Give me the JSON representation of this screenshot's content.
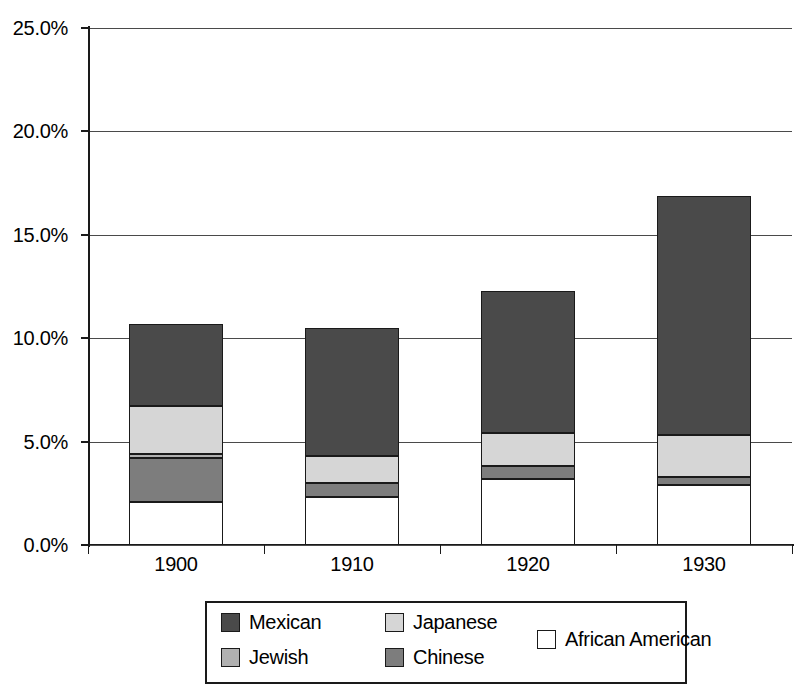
{
  "chart_data": {
    "type": "bar",
    "subtype": "stacked-bar",
    "title": "",
    "xlabel": "",
    "ylabel": "",
    "categories": [
      "1900",
      "1910",
      "1920",
      "1930"
    ],
    "ylim": [
      0,
      25
    ],
    "ytick_labels": [
      "0.0%",
      "5.0%",
      "10.0%",
      "15.0%",
      "20.0%",
      "25.0%"
    ],
    "ytick_values": [
      0,
      5,
      10,
      15,
      20,
      25
    ],
    "yaxis_unit": "%",
    "grid": true,
    "legend_position": "bottom",
    "stack_order_bottom_to_top": [
      "African American",
      "Chinese",
      "Jewish",
      "Japanese",
      "Mexican"
    ],
    "series": [
      {
        "name": "African American",
        "color": "#ffffff",
        "values": [
          2.1,
          2.3,
          3.2,
          2.9
        ]
      },
      {
        "name": "Chinese",
        "color": "#7d7d7d",
        "values": [
          2.1,
          0.7,
          0.6,
          0.4
        ]
      },
      {
        "name": "Jewish",
        "color": "#b0b0b0",
        "values": [
          0.2,
          0.0,
          0.0,
          0.0
        ]
      },
      {
        "name": "Japanese",
        "color": "#d6d6d6",
        "values": [
          2.3,
          1.3,
          1.6,
          2.0
        ]
      },
      {
        "name": "Mexican",
        "color": "#4a4a4a",
        "values": [
          4.0,
          6.2,
          6.9,
          11.6
        ]
      }
    ],
    "totals": [
      10.7,
      10.5,
      16.5,
      22.9
    ],
    "annotations": []
  },
  "legend": {
    "entries": [
      {
        "label": "Mexican",
        "color": "#4a4a4a"
      },
      {
        "label": "Japanese",
        "color": "#d6d6d6"
      },
      {
        "label": "Jewish",
        "color": "#b0b0b0"
      },
      {
        "label": "Chinese",
        "color": "#7d7d7d"
      },
      {
        "label": "African American",
        "color": "#ffffff"
      }
    ]
  }
}
